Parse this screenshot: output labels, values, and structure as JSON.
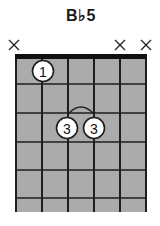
{
  "chord": {
    "name": "B♭5",
    "strings": 6,
    "frets_shown": 6,
    "muted_strings": [
      1,
      5,
      6
    ],
    "muted_symbol": "×",
    "fingers": [
      {
        "string": 2,
        "fret": 1,
        "finger": "1"
      },
      {
        "string": 3,
        "fret": 3,
        "finger": "3"
      },
      {
        "string": 4,
        "fret": 3,
        "finger": "3"
      }
    ],
    "partial_barre": {
      "fret": 3,
      "from_string": 3,
      "to_string": 4
    }
  },
  "colors": {
    "grid_fill": "#ababab",
    "lines": "#1e1e1e",
    "nut": "#111111",
    "finger_fill": "#ffffff"
  }
}
